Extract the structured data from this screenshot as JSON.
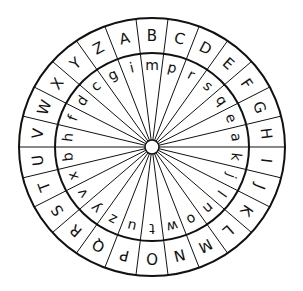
{
  "geometry": {
    "width": 303,
    "height": 291,
    "center": [
      152,
      147
    ],
    "outer_radius_x": 133,
    "outer_radius_y": 129,
    "inner_ring_radius_x": 97,
    "inner_ring_radius_y": 94,
    "hub_radius": 7,
    "sector_count": 26,
    "first_divider_angle_deg": -20.77,
    "stroke_color": "#111111",
    "background": "#ffffff"
  },
  "outer_ring": {
    "letters": [
      "A",
      "B",
      "C",
      "D",
      "E",
      "F",
      "G",
      "H",
      "I",
      "J",
      "K",
      "L",
      "M",
      "N",
      "O",
      "P",
      "Q",
      "R",
      "S",
      "T",
      "U",
      "V",
      "W",
      "X",
      "Y",
      "Z"
    ]
  },
  "inner_ring": {
    "letters": [
      "i",
      "m",
      "p",
      "r",
      "s",
      "q",
      "e",
      "a",
      "k",
      "j",
      "l",
      "n",
      "o",
      "w",
      "t",
      "u",
      "z",
      "y",
      "v",
      "x",
      "b",
      "h",
      "f",
      "d",
      "c",
      "g"
    ]
  }
}
